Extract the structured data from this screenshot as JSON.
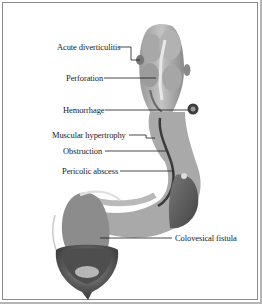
{
  "figure": {
    "style": "grayscale anatomical illustration",
    "colors": {
      "background": "#ffffff",
      "border": "#8a8a8a",
      "label_text": "#1a1a1a",
      "leader_line": "#1a1a1a",
      "colon_light": "#b8b8b8",
      "colon_mid": "#8e8e8e",
      "colon_dark": "#555555",
      "bladder_dark": "#3c3c3c"
    }
  },
  "labels": [
    {
      "id": "acute-diverticulitis",
      "text": "Acute diverticulitis"
    },
    {
      "id": "perforation",
      "text": "Perforation"
    },
    {
      "id": "hemorrhage",
      "text": "Hemorrhage"
    },
    {
      "id": "muscular-hypertrophy",
      "text": "Muscular hypertrophy"
    },
    {
      "id": "obstruction",
      "text": "Obstruction"
    },
    {
      "id": "pericolic-abscess",
      "text": "Pericolic abscess"
    },
    {
      "id": "colovesical-fistula",
      "text": "Colovesical fistula"
    }
  ],
  "structures": [
    {
      "id": "descending-colon",
      "name": "Descending colon"
    },
    {
      "id": "sigmoid-colon",
      "name": "Sigmoid colon"
    },
    {
      "id": "rectum",
      "name": "Rectum"
    },
    {
      "id": "bladder",
      "name": "Urinary bladder"
    }
  ]
}
